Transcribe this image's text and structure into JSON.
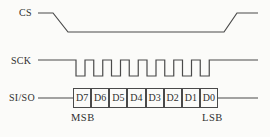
{
  "figure": {
    "type": "timing-diagram",
    "background": "#fbfbf9",
    "line_color": "#4a4a4a",
    "text_color": "#2f2f2f",
    "signals": {
      "cs": {
        "label": "CS"
      },
      "sck": {
        "label": "SCK",
        "clock_cycles": 8
      },
      "siso": {
        "label": "SI/SO",
        "bits": [
          "D7",
          "D6",
          "D5",
          "D4",
          "D3",
          "D2",
          "D1",
          "D0"
        ]
      }
    },
    "annotations": {
      "msb": "MSB",
      "lsb": "LSB"
    }
  }
}
